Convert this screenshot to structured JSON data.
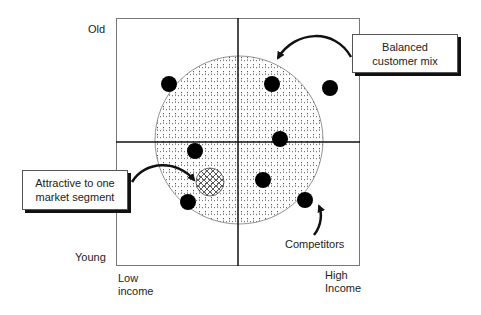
{
  "diagram": {
    "axes": {
      "y_top_label": "Old",
      "y_bottom_label": "Young",
      "x_left_label_line1": "Low",
      "x_left_label_line2": "income",
      "x_right_label_line1": "High",
      "x_right_label_line2": "Income"
    },
    "callouts": {
      "balanced": {
        "line1": "Balanced",
        "line2": "customer mix"
      },
      "segment": {
        "line1": "Attractive to one",
        "line2": "market segment"
      },
      "competitors": "Competitors"
    },
    "colors": {
      "frame": "#666666",
      "axis": "#111111",
      "dot": "#000000",
      "stipple": "#444444"
    },
    "competitor_dots": [
      {
        "x": 169,
        "y": 84
      },
      {
        "x": 272,
        "y": 84
      },
      {
        "x": 330,
        "y": 88
      },
      {
        "x": 280,
        "y": 139
      },
      {
        "x": 195,
        "y": 151
      },
      {
        "x": 263,
        "y": 180
      },
      {
        "x": 188,
        "y": 202
      },
      {
        "x": 305,
        "y": 200
      }
    ]
  }
}
